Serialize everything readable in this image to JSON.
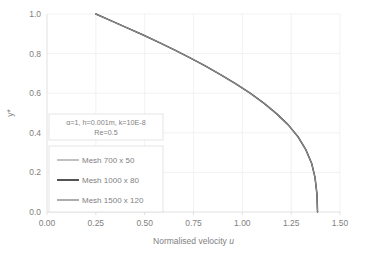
{
  "chart_data": {
    "type": "line",
    "title": "",
    "xlabel": "Normalised velocity u",
    "ylabel": "y*",
    "xlim": [
      0.0,
      1.5
    ],
    "ylim": [
      0.0,
      1.0
    ],
    "xticks": [
      "0.00",
      "0.25",
      "0.50",
      "0.75",
      "1.00",
      "1.25",
      "1.50"
    ],
    "xtick_values": [
      0.0,
      0.25,
      0.5,
      0.75,
      1.0,
      1.25,
      1.5
    ],
    "yticks": [
      "0.0",
      "0.2",
      "0.4",
      "0.6",
      "0.8",
      "1.0"
    ],
    "ytick_values": [
      0.0,
      0.2,
      0.4,
      0.6,
      0.8,
      1.0
    ],
    "grid": true,
    "legend_position": "center-left-inside",
    "series": [
      {
        "name": "Mesh 700 x 50",
        "color": "#a6a6a6",
        "width": 1.1,
        "x": [
          0.25,
          0.33,
          0.41,
          0.49,
          0.57,
          0.65,
          0.73,
          0.81,
          0.89,
          0.965,
          1.04,
          1.11,
          1.175,
          1.235,
          1.285,
          1.325,
          1.355,
          1.372,
          1.382,
          1.385
        ],
        "y": [
          1.0,
          0.965,
          0.93,
          0.895,
          0.858,
          0.82,
          0.78,
          0.738,
          0.693,
          0.648,
          0.6,
          0.55,
          0.497,
          0.44,
          0.38,
          0.315,
          0.245,
          0.175,
          0.09,
          0.0
        ]
      },
      {
        "name": "Mesh 1000 x 80",
        "color": "#404040",
        "width": 1.5,
        "x": [
          0.25,
          0.33,
          0.41,
          0.49,
          0.57,
          0.65,
          0.73,
          0.81,
          0.89,
          0.965,
          1.04,
          1.11,
          1.175,
          1.235,
          1.285,
          1.325,
          1.355,
          1.372,
          1.382,
          1.385
        ],
        "y": [
          1.0,
          0.965,
          0.93,
          0.895,
          0.858,
          0.82,
          0.78,
          0.738,
          0.693,
          0.648,
          0.6,
          0.55,
          0.497,
          0.44,
          0.38,
          0.315,
          0.245,
          0.175,
          0.09,
          0.0
        ]
      },
      {
        "name": "Mesh 1500 x 120",
        "color": "#8c8c8c",
        "width": 1.1,
        "x": [
          0.25,
          0.33,
          0.41,
          0.49,
          0.57,
          0.65,
          0.73,
          0.81,
          0.89,
          0.965,
          1.04,
          1.11,
          1.175,
          1.235,
          1.285,
          1.325,
          1.355,
          1.372,
          1.382,
          1.385
        ],
        "y": [
          1.0,
          0.965,
          0.93,
          0.895,
          0.858,
          0.82,
          0.78,
          0.738,
          0.693,
          0.648,
          0.6,
          0.55,
          0.497,
          0.44,
          0.38,
          0.315,
          0.245,
          0.175,
          0.09,
          0.0
        ]
      }
    ],
    "annotations": [
      {
        "line1": "α=1, h=0.001m, k=10E-8",
        "line2": "Re=0.5"
      }
    ]
  },
  "legend": {
    "items": [
      {
        "label": "Mesh 700 x 50"
      },
      {
        "label": "Mesh 1000 x 80"
      },
      {
        "label": "Mesh 1500 x 120"
      }
    ]
  }
}
